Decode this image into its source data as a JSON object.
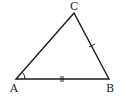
{
  "diagram": {
    "type": "triangle",
    "vertices": [
      {
        "label": "A",
        "x": 16,
        "y": 79
      },
      {
        "label": "B",
        "x": 109,
        "y": 79
      },
      {
        "label": "C",
        "x": 74,
        "y": 13
      }
    ],
    "labels": {
      "a": "A",
      "b": "B",
      "c": "C"
    },
    "marks": {
      "angle_at": "A",
      "double_tick_side": "AB",
      "single_tick_side": "CB"
    },
    "stroke_color": "#1a1a1a"
  }
}
